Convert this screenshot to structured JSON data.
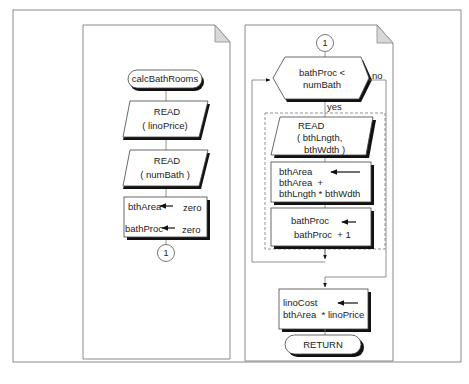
{
  "figure": {
    "type": "flowchart",
    "colors": {
      "frame": "#8a8a8a",
      "line": "#666666",
      "shadow": "#111111",
      "fold": "#d8d8d8",
      "fill": "#ffffff"
    }
  },
  "left_page": {
    "start_terminal": "calcBathRooms",
    "read1": {
      "title": "READ",
      "arg": "( linoPrice)"
    },
    "read2": {
      "title": "READ",
      "arg": "( numBath )"
    },
    "init": {
      "line1_var": "bthArea",
      "line1_val": "zero",
      "line2_var": "bathProc",
      "line2_val": "zero"
    },
    "connector": "1"
  },
  "right_page": {
    "connector": "1",
    "decision": {
      "line1": "bathProc <",
      "line2": "numBath",
      "yes": "yes",
      "no": "no"
    },
    "loop_read": {
      "title": "READ",
      "arg1": "( bthLngth,",
      "arg2": "bthWdth )"
    },
    "area_calc": {
      "target": "bthArea",
      "expr1": "bthArea  +",
      "expr2": "bthLngth * bthWdth"
    },
    "increment": {
      "target": "bathProc",
      "expr": "bathProc  + 1"
    },
    "cost_calc": {
      "target": "linoCost",
      "expr": "bthArea  * linoPrice"
    },
    "end_terminal": "RETURN"
  }
}
